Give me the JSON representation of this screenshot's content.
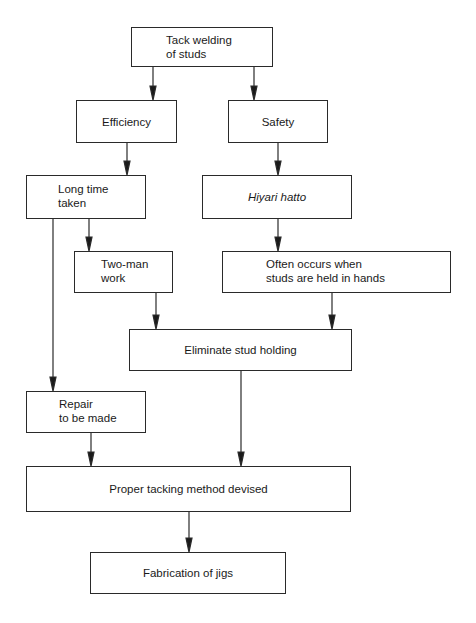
{
  "diagram": {
    "type": "flowchart",
    "nodes": [
      {
        "id": "tack",
        "lines": [
          "Tack welding",
          "of studs"
        ]
      },
      {
        "id": "efficiency",
        "lines": [
          "Efficiency"
        ]
      },
      {
        "id": "safety",
        "lines": [
          "Safety"
        ]
      },
      {
        "id": "long_time",
        "lines": [
          "Long time",
          "taken"
        ]
      },
      {
        "id": "hiyari",
        "lines": [
          "Hiyari hatto"
        ],
        "italic": true
      },
      {
        "id": "two_man",
        "lines": [
          "Two-man",
          "work"
        ]
      },
      {
        "id": "often",
        "lines": [
          "Often occurs when",
          "studs are held in hands"
        ]
      },
      {
        "id": "eliminate",
        "lines": [
          "Eliminate stud holding"
        ]
      },
      {
        "id": "repair",
        "lines": [
          "Repair",
          "to be made"
        ]
      },
      {
        "id": "proper",
        "lines": [
          "Proper tacking method devised"
        ]
      },
      {
        "id": "jigs",
        "lines": [
          "Fabrication of jigs"
        ]
      }
    ],
    "edges": [
      [
        "tack",
        "efficiency"
      ],
      [
        "tack",
        "safety"
      ],
      [
        "efficiency",
        "long_time"
      ],
      [
        "safety",
        "hiyari"
      ],
      [
        "long_time",
        "two_man"
      ],
      [
        "long_time",
        "repair"
      ],
      [
        "hiyari",
        "often"
      ],
      [
        "two_man",
        "eliminate"
      ],
      [
        "often",
        "eliminate"
      ],
      [
        "repair",
        "proper"
      ],
      [
        "eliminate",
        "proper"
      ],
      [
        "proper",
        "jigs"
      ]
    ]
  }
}
